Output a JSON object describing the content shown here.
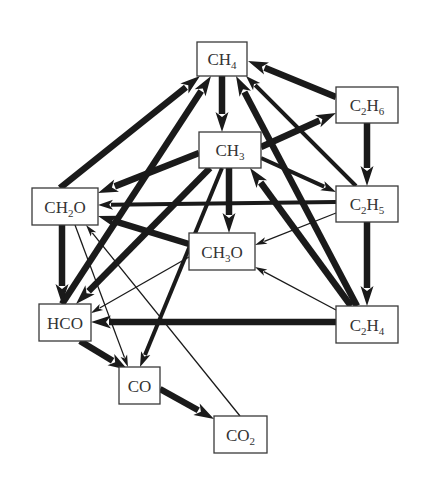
{
  "title": "",
  "nodes": [
    {
      "id": "CH4",
      "parts": [
        [
          "CH",
          ""
        ],
        [
          "4",
          "sub"
        ]
      ]
    },
    {
      "id": "C2H6",
      "parts": [
        [
          "C",
          ""
        ],
        [
          "2",
          "sub"
        ],
        [
          "H",
          ""
        ],
        [
          "6",
          "sub"
        ]
      ]
    },
    {
      "id": "CH3",
      "parts": [
        [
          "CH",
          ""
        ],
        [
          "3",
          "sub"
        ]
      ]
    },
    {
      "id": "C2H5",
      "parts": [
        [
          "C",
          ""
        ],
        [
          "2",
          "sub"
        ],
        [
          "H",
          ""
        ],
        [
          "5",
          "sub"
        ]
      ]
    },
    {
      "id": "CH2O",
      "parts": [
        [
          "CH",
          ""
        ],
        [
          "2",
          "sub"
        ],
        [
          "O",
          ""
        ]
      ]
    },
    {
      "id": "CH3O",
      "parts": [
        [
          "CH",
          ""
        ],
        [
          "3",
          "sub"
        ],
        [
          "O",
          ""
        ]
      ]
    },
    {
      "id": "HCO",
      "parts": [
        [
          "HCO",
          ""
        ]
      ]
    },
    {
      "id": "C2H4",
      "parts": [
        [
          "C",
          ""
        ],
        [
          "2",
          "sub"
        ],
        [
          "H",
          ""
        ],
        [
          "4",
          "sub"
        ]
      ]
    },
    {
      "id": "CO",
      "parts": [
        [
          "CO",
          ""
        ]
      ]
    },
    {
      "id": "CO2",
      "parts": [
        [
          "CO",
          ""
        ],
        [
          "2",
          "sub"
        ]
      ]
    }
  ],
  "edges": [
    {
      "from": "C2H6",
      "to": "CH4",
      "weight": "thick"
    },
    {
      "from": "C2H6",
      "to": "C2H5",
      "weight": "thick"
    },
    {
      "from": "CH4",
      "to": "CH3",
      "weight": "thick"
    },
    {
      "from": "CH3",
      "to": "C2H6",
      "weight": "thick"
    },
    {
      "from": "CH3",
      "to": "C2H5",
      "weight": "medium"
    },
    {
      "from": "CH3",
      "to": "CH2O",
      "weight": "thick"
    },
    {
      "from": "CH3",
      "to": "CH3O",
      "weight": "thick"
    },
    {
      "from": "CH3",
      "to": "HCO",
      "weight": "thick"
    },
    {
      "from": "CH3",
      "to": "CO",
      "weight": "medium"
    },
    {
      "from": "CH2O",
      "to": "CH4",
      "weight": "thick"
    },
    {
      "from": "HCO",
      "to": "CH4",
      "weight": "thick"
    },
    {
      "from": "C2H5",
      "to": "CH4",
      "weight": "medium"
    },
    {
      "from": "C2H4",
      "to": "CH4",
      "weight": "thick"
    },
    {
      "from": "C2H4",
      "to": "CH3",
      "weight": "thick"
    },
    {
      "from": "C2H5",
      "to": "CH2O",
      "weight": "medium"
    },
    {
      "from": "C2H5",
      "to": "CH3O",
      "weight": "thin"
    },
    {
      "from": "C2H5",
      "to": "C2H4",
      "weight": "thick"
    },
    {
      "from": "C2H4",
      "to": "HCO",
      "weight": "thick"
    },
    {
      "from": "C2H4",
      "to": "CH3O",
      "weight": "thin"
    },
    {
      "from": "CH3O",
      "to": "CH2O",
      "weight": "thick"
    },
    {
      "from": "CH3O",
      "to": "HCO",
      "weight": "thin"
    },
    {
      "from": "CH2O",
      "to": "HCO",
      "weight": "thick"
    },
    {
      "from": "CH2O",
      "to": "CO",
      "weight": "thin"
    },
    {
      "from": "HCO",
      "to": "CO",
      "weight": "thick"
    },
    {
      "from": "CO",
      "to": "CO2",
      "weight": "thick"
    },
    {
      "from": "CO2",
      "to": "CH2O",
      "weight": "thin"
    }
  ]
}
